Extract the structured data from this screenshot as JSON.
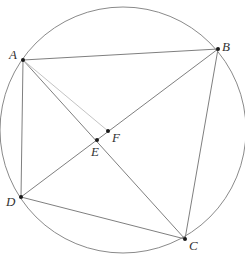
{
  "diagram": {
    "type": "cyclic quadrilateral inscribed in circle",
    "circle": {
      "cx": 123,
      "cy": 130,
      "r": 123,
      "stroke": "#8a8a8a"
    },
    "points": [
      {
        "id": "A",
        "label": "A",
        "x": 23,
        "y": 60,
        "lx": 9,
        "ly": 59
      },
      {
        "id": "B",
        "label": "B",
        "x": 218,
        "y": 49,
        "lx": 222,
        "ly": 51
      },
      {
        "id": "C",
        "label": "C",
        "x": 185,
        "y": 239,
        "lx": 189,
        "ly": 250
      },
      {
        "id": "D",
        "label": "D",
        "x": 21,
        "y": 197,
        "lx": 6,
        "ly": 206
      },
      {
        "id": "E",
        "label": "E",
        "x": 97,
        "y": 140,
        "lx": 91,
        "ly": 156
      },
      {
        "id": "F",
        "label": "F",
        "x": 108,
        "y": 131,
        "lx": 112,
        "ly": 142
      }
    ],
    "segments": [
      {
        "from": "A",
        "to": "B",
        "style": "solid"
      },
      {
        "from": "A",
        "to": "C",
        "style": "solid"
      },
      {
        "from": "A",
        "to": "D",
        "style": "solid"
      },
      {
        "from": "B",
        "to": "D",
        "style": "solid"
      },
      {
        "from": "B",
        "to": "C",
        "style": "solid"
      },
      {
        "from": "D",
        "to": "C",
        "style": "solid"
      },
      {
        "from": "A",
        "to": "F",
        "style": "faint"
      }
    ],
    "colors": {
      "line": "#7f7f7f",
      "faint_line": "#c4c4c4",
      "point": "#1a1a1a",
      "label": "#333333"
    }
  }
}
